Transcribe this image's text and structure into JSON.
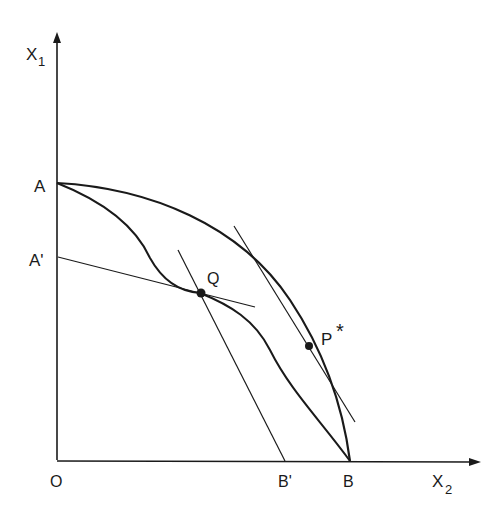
{
  "diagram": {
    "axes": {
      "y_label_main": "X",
      "y_label_sub": "1",
      "x_label_main": "X",
      "x_label_sub": "2",
      "origin_label": "O"
    },
    "points": {
      "A": "A",
      "A_prime": "A'",
      "B": "B",
      "B_prime": "B'",
      "Q": "Q",
      "P_star_main": "P",
      "P_star_mark": "*"
    },
    "curves": [
      {
        "name": "outer-frontier",
        "from": "A",
        "to": "B",
        "shape": "concave"
      },
      {
        "name": "inner-frontier",
        "from": "A",
        "to": "B",
        "shape": "wavy"
      }
    ],
    "lines": [
      {
        "name": "price-line-A-prime",
        "from": "A'",
        "through": "Q"
      },
      {
        "name": "price-line-B-prime",
        "to": "B'",
        "through": "Q"
      },
      {
        "name": "tangent-at-P-star",
        "tangent_to": "outer-frontier",
        "at": "P*"
      }
    ],
    "colors": {
      "ink": "#1a1a1a",
      "background": "#ffffff"
    }
  }
}
